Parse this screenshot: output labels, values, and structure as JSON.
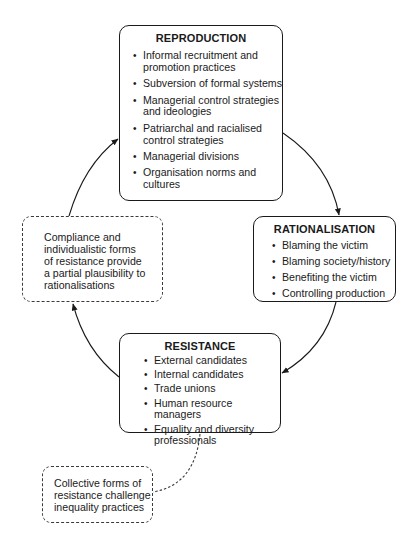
{
  "diagram": {
    "type": "cycle",
    "nodes": {
      "reproduction": {
        "title": "REPRODUCTION",
        "items": [
          "Informal recruitment and promotion practices",
          "Subversion of formal systems",
          "Managerial control strategies and ideologies",
          "Patriarchal and racialised control strategies",
          "Managerial divisions",
          "Organisation norms and cultures"
        ],
        "lines": [
          [
            "Informal recruitment and",
            "promotion practices"
          ],
          [
            "Subversion of formal systems"
          ],
          [
            "Managerial control strategies",
            "and ideologies"
          ],
          [
            "Patriarchal and racialised",
            "control strategies"
          ],
          [
            "Managerial divisions"
          ],
          [
            "Organisation norms and",
            "cultures"
          ]
        ]
      },
      "rationalisation": {
        "title": "RATIONALISATION",
        "items": [
          "Blaming the victim",
          "Blaming society/history",
          "Benefiting the victim",
          "Controlling production"
        ]
      },
      "resistance": {
        "title": "RESISTANCE",
        "items": [
          "External candidates",
          "Internal candidates",
          "Trade unions",
          "Human resource managers",
          "Equality and diversity professionals"
        ],
        "lines": [
          [
            "External candidates"
          ],
          [
            "Internal candidates"
          ],
          [
            "Trade unions"
          ],
          [
            "Human resource managers"
          ],
          [
            "Equality and diversity",
            "professionals"
          ]
        ]
      },
      "compliance_note": {
        "text": "Compliance and individualistic forms of resistance provide a partial plausibility to rationalisations",
        "lines": [
          "Compliance and",
          "individualistic forms",
          "of resistance provide",
          "a partial plausibility to",
          "rationalisations"
        ]
      },
      "collective_note": {
        "text": "Collective forms of resistance challenge inequality practices",
        "lines": [
          "Collective forms of",
          "resistance challenge",
          "inequality practices"
        ]
      }
    },
    "edges": [
      {
        "from": "reproduction",
        "to": "rationalisation",
        "style": "solid-arrow"
      },
      {
        "from": "rationalisation",
        "to": "resistance",
        "style": "solid-arrow"
      },
      {
        "from": "resistance",
        "to": "compliance_note",
        "style": "solid-arrow"
      },
      {
        "from": "compliance_note",
        "to": "reproduction",
        "style": "solid-arrow"
      },
      {
        "from": "resistance",
        "to": "collective_note",
        "style": "dashed-line"
      }
    ],
    "bullet_glyph": "•",
    "colors": {
      "line": "#1a1a1a",
      "dashed": "#3a3a3a",
      "background": "#ffffff"
    }
  }
}
